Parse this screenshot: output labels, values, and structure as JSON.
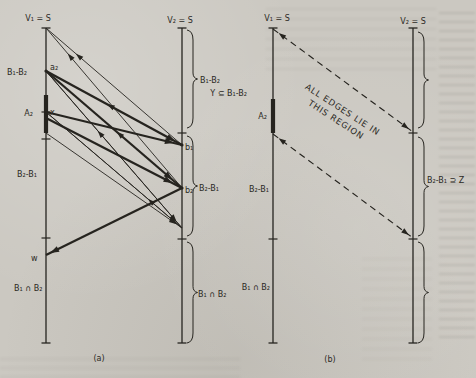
{
  "page": {
    "background": "#cbc8c1",
    "ink": "#26241f"
  },
  "diagram": {
    "width": 476,
    "height": 378,
    "verticals": [
      {
        "id": "a-v1",
        "x": 46,
        "y1": 28,
        "y2": 343
      },
      {
        "id": "a-v2",
        "x": 182,
        "y1": 28,
        "y2": 343
      },
      {
        "id": "b-v1",
        "x": 273,
        "y1": 28,
        "y2": 343
      },
      {
        "id": "b-v2",
        "x": 413,
        "y1": 28,
        "y2": 343
      }
    ],
    "thick_segments": [
      {
        "id": "a-A2-segment",
        "x": 46,
        "y1": 95,
        "y2": 133
      },
      {
        "id": "b-A2-segment",
        "x": 273,
        "y1": 99,
        "y2": 133
      }
    ],
    "ticks": [
      {
        "x": 46,
        "y": 112
      },
      {
        "x": 46,
        "y": 139
      },
      {
        "x": 46,
        "y": 238
      },
      {
        "x": 182,
        "y": 133
      },
      {
        "x": 182,
        "y": 239
      },
      {
        "x": 273,
        "y": 239
      },
      {
        "x": 413,
        "y": 133
      },
      {
        "x": 413,
        "y": 239
      }
    ],
    "dots": [
      {
        "x": 46,
        "y": 71
      },
      {
        "x": 182,
        "y": 145
      },
      {
        "x": 182,
        "y": 188
      }
    ],
    "edges": [
      {
        "x1": 182,
        "y1": 145,
        "x2": 46,
        "y2": 28,
        "style": "thin",
        "arrows": [
          {
            "t": 0.78
          }
        ]
      },
      {
        "x1": 182,
        "y1": 188,
        "x2": 46,
        "y2": 28,
        "style": "thin",
        "arrows": [
          {
            "t": 0.84
          }
        ]
      },
      {
        "x1": 182,
        "y1": 145,
        "x2": 46,
        "y2": 71,
        "style": "thin",
        "arrows": [
          {
            "t": 0.55
          }
        ]
      },
      {
        "x1": 182,
        "y1": 188,
        "x2": 46,
        "y2": 71,
        "style": "thin",
        "arrows": [
          {
            "t": 0.48
          }
        ]
      },
      {
        "x1": 182,
        "y1": 228,
        "x2": 46,
        "y2": 71,
        "style": "thin",
        "arrows": [
          {
            "t": 0.62
          }
        ]
      },
      {
        "x1": 182,
        "y1": 228,
        "x2": 46,
        "y2": 112,
        "style": "thin",
        "arrows": [
          {
            "t": 0.25
          }
        ]
      },
      {
        "x1": 46,
        "y1": 71,
        "x2": 182,
        "y2": 145,
        "style": "thick",
        "arrows": [
          {
            "t": 0.95
          }
        ]
      },
      {
        "x1": 46,
        "y1": 71,
        "x2": 182,
        "y2": 188,
        "style": "thick",
        "arrows": [
          {
            "t": 0.93
          }
        ]
      },
      {
        "x1": 46,
        "y1": 112,
        "x2": 182,
        "y2": 145,
        "style": "thick",
        "arrows": [
          {
            "t": 0.94
          }
        ]
      },
      {
        "x1": 46,
        "y1": 118,
        "x2": 182,
        "y2": 188,
        "style": "thick",
        "arrows": [
          {
            "t": 0.93
          }
        ]
      },
      {
        "x1": 46,
        "y1": 71,
        "x2": 182,
        "y2": 228,
        "style": "thin",
        "arrows": [
          {
            "t": 0.96
          }
        ]
      },
      {
        "x1": 46,
        "y1": 112,
        "x2": 182,
        "y2": 228,
        "style": "thin",
        "arrows": [
          {
            "t": 0.96
          }
        ]
      },
      {
        "x1": 46,
        "y1": 133,
        "x2": 182,
        "y2": 228,
        "style": "thin",
        "arrows": [
          {
            "t": 0.96
          }
        ]
      },
      {
        "x1": 182,
        "y1": 188,
        "x2": 46,
        "y2": 255,
        "style": "thick",
        "arrows": [
          {
            "t": 0.97
          }
        ]
      },
      {
        "x1": 273,
        "y1": 29,
        "x2": 413,
        "y2": 132,
        "style": "dashed",
        "arrows": [
          {
            "t": 0.04,
            "dir": "back"
          },
          {
            "t": 0.97
          }
        ]
      },
      {
        "x1": 273,
        "y1": 134,
        "x2": 413,
        "y2": 238,
        "style": "dashed",
        "arrows": [
          {
            "t": 0.04,
            "dir": "back"
          },
          {
            "t": 0.97
          }
        ]
      }
    ],
    "braces": [
      {
        "id": "a-brace-b1b2",
        "x": 187,
        "y1": 30,
        "y2": 128
      },
      {
        "id": "a-brace-b2b1",
        "x": 187,
        "y1": 136,
        "y2": 236
      },
      {
        "id": "a-brace-b1nb2",
        "x": 187,
        "y1": 242,
        "y2": 343
      },
      {
        "id": "b-brace-top",
        "x": 418,
        "y1": 32,
        "y2": 128
      },
      {
        "id": "b-brace-b2b1z",
        "x": 418,
        "y1": 137,
        "y2": 236
      },
      {
        "id": "b-brace-bottom",
        "x": 418,
        "y1": 242,
        "y2": 343
      }
    ],
    "labels": [
      {
        "id": "a-v1-title",
        "text": "V₁ = S",
        "x": 38,
        "y": 21,
        "anchor": "middle"
      },
      {
        "id": "a-v2-title",
        "text": "V₂ = S",
        "x": 180,
        "y": 23,
        "anchor": "middle"
      },
      {
        "id": "a-b1b2-left",
        "text": "B₁-B₂",
        "x": 7,
        "y": 75,
        "anchor": "start"
      },
      {
        "id": "a-node-a2",
        "text": "a₂",
        "x": 50,
        "y": 70,
        "anchor": "start"
      },
      {
        "id": "a-A2",
        "text": "A₂",
        "x": 33,
        "y": 116,
        "anchor": "end"
      },
      {
        "id": "a-node-x",
        "text": "x",
        "x": 50,
        "y": 115,
        "anchor": "start"
      },
      {
        "id": "a-b2b1-left",
        "text": "B₂-B₁",
        "x": 17,
        "y": 177,
        "anchor": "start"
      },
      {
        "id": "a-node-w",
        "text": "w",
        "x": 31,
        "y": 261,
        "anchor": "start"
      },
      {
        "id": "a-b1nb2-left",
        "text": "B₁ ∩ B₂",
        "x": 14,
        "y": 291,
        "anchor": "start"
      },
      {
        "id": "a-b1b2-right",
        "text": "B₁-B₂",
        "x": 200,
        "y": 83,
        "anchor": "start"
      },
      {
        "id": "a-node-b1",
        "text": "b₁",
        "x": 185,
        "y": 150,
        "anchor": "start"
      },
      {
        "id": "a-node-b2",
        "text": "b₂",
        "x": 185,
        "y": 193,
        "anchor": "start"
      },
      {
        "id": "a-b2b1-right",
        "text": "B₂-B₁",
        "x": 199,
        "y": 191,
        "anchor": "start"
      },
      {
        "id": "a-b1nb2-right",
        "text": "B₁ ∩ B₂",
        "x": 198,
        "y": 297,
        "anchor": "start"
      },
      {
        "id": "a-caption",
        "text": "(a)",
        "x": 99,
        "y": 361,
        "anchor": "middle"
      },
      {
        "id": "b-v1-title",
        "text": "V₁ = S",
        "x": 277,
        "y": 21,
        "anchor": "middle"
      },
      {
        "id": "b-v2-title",
        "text": "V₂ = S",
        "x": 413,
        "y": 24,
        "anchor": "middle"
      },
      {
        "id": "b-y-subset",
        "text": "Y ⊆ B₁-B₂",
        "x": 247,
        "y": 96,
        "anchor": "end"
      },
      {
        "id": "b-A2",
        "text": "A₂",
        "x": 267,
        "y": 119,
        "anchor": "end"
      },
      {
        "id": "b-b2b1-left",
        "text": "B₂-B₁",
        "x": 269,
        "y": 192,
        "anchor": "end"
      },
      {
        "id": "b-b1nb2-left",
        "text": "B₁ ∩ B₂",
        "x": 270,
        "y": 290,
        "anchor": "end"
      },
      {
        "id": "b-b2b1-supset-z",
        "text": "B₂-B₁ ⊇ Z",
        "x": 427,
        "y": 183,
        "anchor": "start"
      },
      {
        "id": "b-caption",
        "text": "(b)",
        "x": 330,
        "y": 362,
        "anchor": "middle"
      }
    ],
    "rotated_label": {
      "id": "b-region-note",
      "lines": [
        "ALL EDGES LIE IN",
        "THIS REGION"
      ],
      "x": 341,
      "y": 112,
      "line_height": 12,
      "angle": 33
    }
  }
}
